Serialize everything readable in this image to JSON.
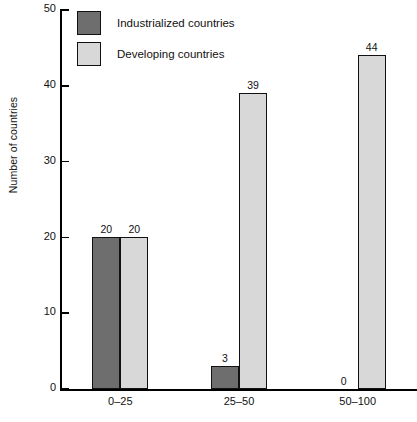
{
  "chart_data": {
    "type": "bar",
    "title": "",
    "subtitle": "",
    "xlabel": "",
    "ylabel": "Number of countries",
    "categories": [
      "0–25",
      "25–50",
      "50–100"
    ],
    "series": [
      {
        "name": "Industrialized countries",
        "values": [
          20,
          3,
          0
        ],
        "color": "#6e6e6e"
      },
      {
        "name": "Developing countries",
        "values": [
          20,
          39,
          44
        ],
        "color": "#d8d8d8"
      }
    ],
    "ylim": [
      0,
      50
    ],
    "yticks": [
      0,
      10,
      20,
      30,
      40,
      50
    ],
    "ytick_labels": [
      "0",
      "10",
      "20",
      "30",
      "40",
      "50"
    ],
    "grid": false,
    "legend_position": "top-left",
    "data_labels": [
      [
        "20",
        "3",
        "0"
      ],
      [
        "20",
        "39",
        "44"
      ]
    ]
  },
  "legend": {
    "items": [
      {
        "label": "Industrialized countries",
        "swatch": "dark-swatch"
      },
      {
        "label": "Developing countries",
        "swatch": "light-swatch"
      }
    ]
  },
  "axes": {
    "y_title": "Number of countries",
    "y_ticks": [
      "50",
      "40",
      "30",
      "20",
      "10",
      "0"
    ],
    "x_ticks": [
      "0–25",
      "25–50",
      "50–100"
    ]
  }
}
